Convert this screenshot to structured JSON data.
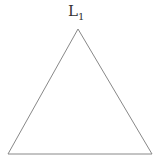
{
  "diagram": {
    "shape": "triangle",
    "vertex_label": {
      "main": "L",
      "sub": "1"
    },
    "stroke_color": "#888888",
    "points": [
      [
        78,
        29
      ],
      [
        8,
        154
      ],
      [
        152,
        154
      ]
    ]
  }
}
